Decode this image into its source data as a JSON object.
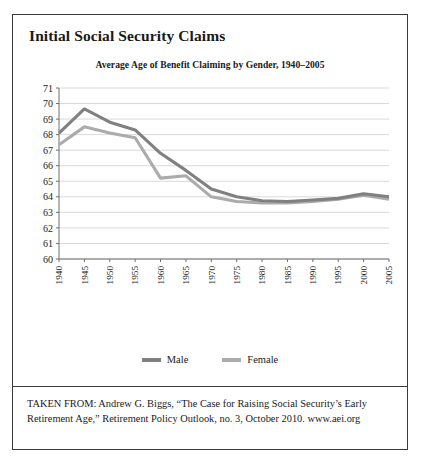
{
  "figure": {
    "title": "Initial Social Security Claims",
    "source_note": "TAKEN FROM: Andrew G. Biggs, “The Case for Raising Social Security’s Early Retirement Age,” Retirement Policy Outlook, no. 3, October 2010. www.aei.org"
  },
  "legend": {
    "position": "bottom-center",
    "entries": [
      {
        "label": "Male",
        "color": "#808080"
      },
      {
        "label": "Female",
        "color": "#ababab"
      }
    ]
  },
  "colors": {
    "male": "#808080",
    "female": "#ababab",
    "gridline": "#c9c9c9",
    "axis": "#6f6f6f",
    "frame": "#3a3a3a",
    "text": "#1a1a1a"
  },
  "chart_data": {
    "type": "line",
    "title": "Average Age of Benefit Claiming by Gender, 1940–2005",
    "xlabel": "",
    "ylabel": "",
    "categories": [
      "1940",
      "1945",
      "1950",
      "1955",
      "1960",
      "1965",
      "1970",
      "1975",
      "1980",
      "1985",
      "1990",
      "1995",
      "2000",
      "2005"
    ],
    "x_tick_labels": [
      "1940",
      "1945",
      "1950",
      "1955",
      "1960",
      "1965",
      "1970",
      "1975",
      "1980",
      "1985",
      "1990",
      "1995",
      "2000",
      "2005"
    ],
    "y_tick_labels": [
      "60",
      "61",
      "62",
      "63",
      "64",
      "65",
      "66",
      "67",
      "68",
      "69",
      "70",
      "71"
    ],
    "ylim": [
      60,
      71
    ],
    "xlim": [
      "1940",
      "2005"
    ],
    "grid": true,
    "x_tick_label_rotation": -90,
    "series": [
      {
        "name": "Male",
        "color": "#808080",
        "values": [
          68.1,
          69.65,
          68.8,
          68.3,
          66.8,
          65.7,
          64.5,
          64.0,
          63.75,
          63.7,
          63.8,
          63.9,
          64.2,
          64.0
        ]
      },
      {
        "name": "Female",
        "color": "#ababab",
        "values": [
          67.35,
          68.5,
          68.1,
          67.8,
          65.2,
          65.35,
          64.0,
          63.7,
          63.6,
          63.6,
          63.7,
          63.85,
          64.1,
          63.85
        ]
      }
    ]
  }
}
